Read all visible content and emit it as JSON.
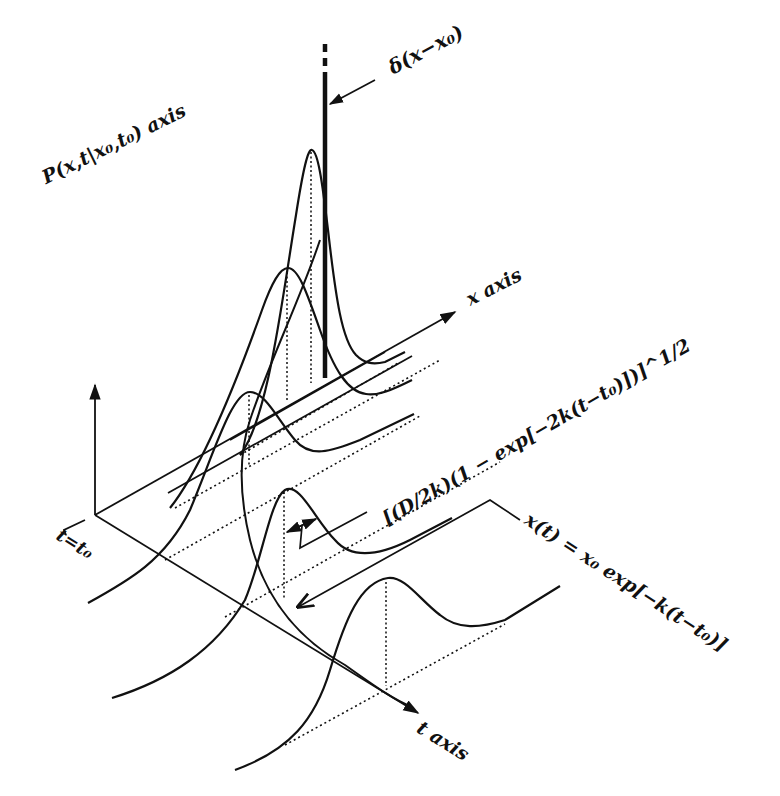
{
  "figure": {
    "type": "3d-sketch"
  },
  "axes": {
    "p_axis_label": "P(x,t|x₀,t₀) axis",
    "x_axis_label": "x axis",
    "t_axis_label": "t axis",
    "origin_label": "t=t₀"
  },
  "annotations": {
    "delta_label": "δ(x−x₀)",
    "width_label": "[(D/2k)(1 − exp[−2k(t−t₀)])]^1/2",
    "mean_label": "x(t) = x₀ exp[−k(t−t₀)]"
  },
  "curves": [
    {
      "name": "delta-spike",
      "t_index": 0,
      "description": "Dirac delta at x₀ at t = t₀"
    },
    {
      "name": "gaussian-1",
      "t_index": 1,
      "description": "narrow tall peak"
    },
    {
      "name": "gaussian-2",
      "t_index": 2,
      "description": "wider, lower peak"
    },
    {
      "name": "gaussian-3",
      "t_index": 3,
      "description": "wider still"
    },
    {
      "name": "gaussian-4",
      "t_index": 4,
      "description": "wider still"
    },
    {
      "name": "gaussian-5",
      "t_index": 5,
      "description": "approaching stationary distribution"
    }
  ],
  "colors": {
    "ink": "#111111",
    "background": "#ffffff"
  }
}
